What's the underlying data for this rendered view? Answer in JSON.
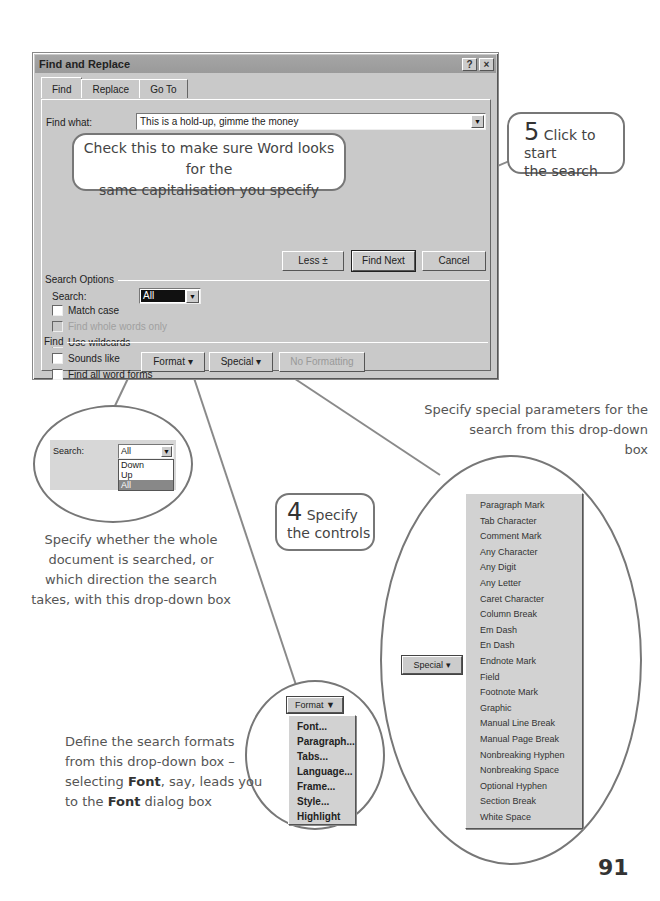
{
  "dialog": {
    "title": "Find and Replace",
    "help_button": "?",
    "close_button": "×",
    "tabs": [
      {
        "label": "Find",
        "active": true
      },
      {
        "label": "Replace",
        "active": false
      },
      {
        "label": "Go To",
        "active": false
      }
    ],
    "find_what_label": "Find what:",
    "find_what_value": "This is a hold-up, gimme the money",
    "buttons": {
      "less": "Less ±",
      "find_next": "Find Next",
      "cancel": "Cancel",
      "format": "Format ▾",
      "special": "Special ▾",
      "no_formatting": "No Formatting"
    },
    "search_options_label": "Search Options",
    "search_label": "Search:",
    "search_value": "All",
    "checkboxes": [
      {
        "label": "Match case",
        "checked": false,
        "enabled": true
      },
      {
        "label": "Find whole words only",
        "checked": false,
        "enabled": false
      },
      {
        "label": "Use wildcards",
        "checked": false,
        "enabled": true
      },
      {
        "label": "Sounds like",
        "checked": false,
        "enabled": true
      },
      {
        "label": "Find all word forms",
        "checked": false,
        "enabled": true
      }
    ],
    "find_group_label": "Find"
  },
  "callouts": {
    "match_case": "Check this to make sure Word looks for the same capitalisation you specify",
    "match_case_line1": "Check this to make sure Word looks for the",
    "match_case_line2": "same capitalisation you specify",
    "step5_number": "5",
    "step5_text1": "Click to start",
    "step5_text2": "the search",
    "step4_number": "4",
    "step4_text1": "Specify",
    "step4_text2": "the controls"
  },
  "search_inset": {
    "label": "Search:",
    "value": "All",
    "options": [
      "Down",
      "Up",
      "All"
    ],
    "selected": "All"
  },
  "special_inset": {
    "button": "Special ▾",
    "items": [
      "Paragraph Mark",
      "Tab Character",
      "Comment Mark",
      "Any Character",
      "Any Digit",
      "Any Letter",
      "Caret Character",
      "Column Break",
      "Em Dash",
      "En Dash",
      "Endnote Mark",
      "Field",
      "Footnote Mark",
      "Graphic",
      "Manual Line Break",
      "Manual Page Break",
      "Nonbreaking Hyphen",
      "Nonbreaking Space",
      "Optional Hyphen",
      "Section Break",
      "White Space"
    ]
  },
  "format_inset": {
    "button": "Format ▼",
    "items": [
      "Font...",
      "Paragraph...",
      "Tabs...",
      "Language...",
      "Frame...",
      "Style...",
      "Highlight"
    ]
  },
  "captions": {
    "special": [
      "Specify special parameters for the",
      "search from this drop-down",
      "box"
    ],
    "search": [
      "Specify whether the whole",
      "document is searched, or",
      "which direction the search",
      "takes, with this drop-down box"
    ],
    "format_line1": "Define the search formats",
    "format_line2": "from this drop-down box –",
    "format_line3a": "selecting ",
    "format_line3b": "Font",
    "format_line3c": ", say, leads you",
    "format_line4a": "to the ",
    "format_line4b": "Font",
    "format_line4c": " dialog box"
  },
  "page_number": "91"
}
